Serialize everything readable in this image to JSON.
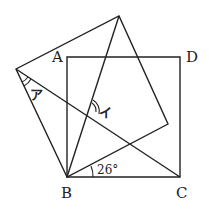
{
  "diagram": {
    "type": "geometry",
    "stroke_color": "#222222",
    "background": "#ffffff",
    "points": {
      "A": {
        "label": "A",
        "x": 67,
        "y": 57
      },
      "B": {
        "label": "B",
        "x": 67,
        "y": 177
      },
      "C": {
        "label": "C",
        "x": 180,
        "y": 177
      },
      "D": {
        "label": "D",
        "x": 180,
        "y": 57
      },
      "P": {
        "label": "",
        "x": 16,
        "y": 69
      },
      "Q": {
        "label": "",
        "x": 119,
        "y": 16
      },
      "R": {
        "label": "",
        "x": 168,
        "y": 124
      }
    },
    "labels": {
      "A": "A",
      "B": "B",
      "C": "C",
      "D": "D",
      "angle_a": "ア",
      "angle_i": "イ",
      "angle_26": "26°"
    },
    "segments": [
      [
        "A",
        "B"
      ],
      [
        "B",
        "C"
      ],
      [
        "C",
        "D"
      ],
      [
        "D",
        "A"
      ],
      [
        "B",
        "P"
      ],
      [
        "P",
        "Q"
      ],
      [
        "Q",
        "R"
      ],
      [
        "R",
        "B"
      ],
      [
        "P",
        "C"
      ],
      [
        "B",
        "Q"
      ]
    ]
  }
}
